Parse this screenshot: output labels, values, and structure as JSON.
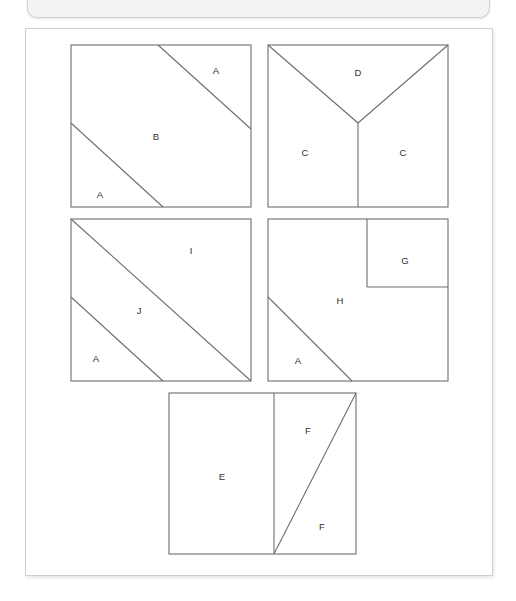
{
  "top_bar": {
    "text": "",
    "visible": true
  },
  "panel": {
    "background_color": "#ffffff",
    "border_color": "#cfcfcf"
  },
  "figure": {
    "stroke_color": "#6e6e6e",
    "label_color": "#2f2f2f",
    "squares": [
      {
        "id": "square-1",
        "x": 45,
        "y": 16,
        "w": 180,
        "h": 162,
        "description": "square divided by two parallel diagonals into three regions",
        "labels": [
          {
            "text": "A",
            "x": 190,
            "y": 42
          },
          {
            "text": "B",
            "x": 130,
            "y": 108
          },
          {
            "text": "A",
            "x": 74,
            "y": 166
          }
        ]
      },
      {
        "id": "square-2",
        "x": 242,
        "y": 16,
        "w": 180,
        "h": 162,
        "description": "square divided by a Y shape into one top region and two bottom regions",
        "labels": [
          {
            "text": "D",
            "x": 332,
            "y": 44
          },
          {
            "text": "C",
            "x": 279,
            "y": 124
          },
          {
            "text": "C",
            "x": 377,
            "y": 124
          }
        ]
      },
      {
        "id": "square-3",
        "x": 45,
        "y": 190,
        "w": 180,
        "h": 162,
        "description": "square divided by main diagonal plus a parallel diagonal into three regions",
        "labels": [
          {
            "text": "I",
            "x": 165,
            "y": 32
          },
          {
            "text": "J",
            "x": 113,
            "y": 92
          },
          {
            "text": "A",
            "x": 70,
            "y": 140
          }
        ]
      },
      {
        "id": "square-4",
        "x": 242,
        "y": 190,
        "w": 180,
        "h": 162,
        "description": "square with small square cut from top right corner and a small triangle at bottom left",
        "labels": [
          {
            "text": "G",
            "x": 379,
            "y": 42
          },
          {
            "text": "H",
            "x": 314,
            "y": 82
          },
          {
            "text": "A",
            "x": 272,
            "y": 142
          }
        ]
      },
      {
        "id": "square-5",
        "x": 143,
        "y": 364,
        "w": 187,
        "h": 161,
        "description": "square split by a vertical line, right portion split by a diagonal into two triangles",
        "labels": [
          {
            "text": "E",
            "x": 196,
            "y": 84
          },
          {
            "text": "F",
            "x": 282,
            "y": 38
          },
          {
            "text": "F",
            "x": 296,
            "y": 134
          }
        ]
      }
    ],
    "region_letters": [
      "A",
      "B",
      "C",
      "D",
      "E",
      "F",
      "G",
      "H",
      "I",
      "J"
    ]
  }
}
